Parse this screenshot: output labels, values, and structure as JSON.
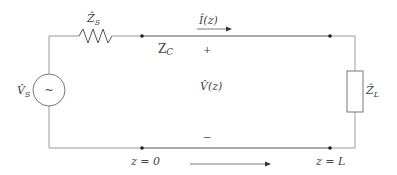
{
  "diagram": {
    "colors": {
      "wire_light": "#9a9a9a",
      "wire_dark": "#555555",
      "node": "#222222",
      "text": "#444444"
    },
    "source": {
      "label_main": "V̂",
      "label_sub": "S",
      "symbol": "~"
    },
    "source_impedance": {
      "label_main": "Ẑ",
      "label_sub": "S"
    },
    "line_impedance": {
      "label_main": "Z",
      "label_sub": "C"
    },
    "current": {
      "label": "Î(z)"
    },
    "voltage": {
      "label": "V̂(z)",
      "plus": "+",
      "minus": "−"
    },
    "load": {
      "label_main": "Ẑ",
      "label_sub": "L"
    },
    "positions": {
      "start": "z = 0",
      "end": "z = L"
    }
  }
}
